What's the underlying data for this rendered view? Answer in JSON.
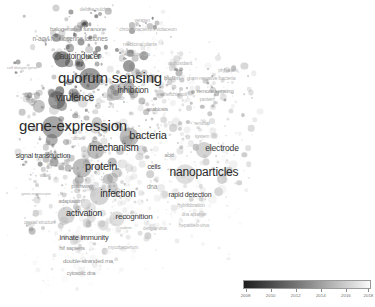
{
  "app": {
    "type": "bibliometric-overlay-map",
    "tool": "VOSviewer",
    "background_color": "#ffffff",
    "width": 375,
    "height": 307
  },
  "legend": {
    "name": "overlay-year-scale",
    "orientation": "horizontal",
    "position": "bottom-right",
    "gradient_from": "#1d1d1d",
    "gradient_to": "#fbfbfb",
    "min_year": 2008,
    "max_year": 2018,
    "ticks": [
      {
        "label": "2008",
        "pos": 2
      },
      {
        "label": "2010",
        "pos": 21.6
      },
      {
        "label": "2012",
        "pos": 41.2
      },
      {
        "label": "2014",
        "pos": 60.8
      },
      {
        "label": "2016",
        "pos": 80.4
      },
      {
        "label": "2018",
        "pos": 98
      }
    ]
  },
  "chart_data": {
    "type": "scatter",
    "title": "",
    "xlabel": "",
    "ylabel": "",
    "colormap": "grayscale-year-overlay",
    "color_range": [
      2008,
      2018
    ],
    "legend_position": "bottom-right",
    "grid": false,
    "terms": [
      {
        "label": "delisea pulchra",
        "x": 95,
        "y": 9,
        "size": 5.0,
        "weight": 0.22,
        "year": 2009,
        "style": "veryfaint"
      },
      {
        "label": "veragen",
        "x": 142,
        "y": 21,
        "size": 4.6,
        "weight": 0.18,
        "year": 2010,
        "style": "veryfaint"
      },
      {
        "label": "halogenated furanone",
        "x": 78,
        "y": 29,
        "size": 6.2,
        "weight": 0.4,
        "year": 2009,
        "style": "faint"
      },
      {
        "label": "chromobacterium violaceum",
        "x": 148,
        "y": 29,
        "size": 5.0,
        "weight": 0.22,
        "year": 2011,
        "style": "veryfaint"
      },
      {
        "label": "n-acyl homoserine lactones",
        "x": 70,
        "y": 39,
        "size": 6.6,
        "weight": 0.45,
        "year": 2009,
        "style": "faint"
      },
      {
        "label": "medicinal plants",
        "x": 140,
        "y": 45,
        "size": 5.2,
        "weight": 0.26,
        "year": 2015,
        "style": "veryfaint"
      },
      {
        "label": "essential oils",
        "x": 137,
        "y": 54,
        "size": 5.0,
        "weight": 0.22,
        "year": 2016,
        "style": "veryfaint"
      },
      {
        "label": "autoinducer",
        "x": 80,
        "y": 57,
        "size": 8.2,
        "weight": 0.6,
        "year": 2009,
        "style": "normal"
      },
      {
        "label": "cell division gene",
        "x": 22,
        "y": 68,
        "size": 4.4,
        "weight": 0.16,
        "year": 2010,
        "style": "veryfaint"
      },
      {
        "label": "antioxidant",
        "x": 180,
        "y": 64,
        "size": 5.4,
        "weight": 0.28,
        "year": 2016,
        "style": "veryfaint"
      },
      {
        "label": "quorum sensing",
        "x": 110,
        "y": 77,
        "size": 15.0,
        "weight": 1.0,
        "year": 2010,
        "style": "major"
      },
      {
        "label": "physalarm",
        "x": 228,
        "y": 71,
        "size": 4.6,
        "weight": 0.18,
        "year": 2014,
        "style": "veryfaint"
      },
      {
        "label": "biofilm",
        "x": 172,
        "y": 78,
        "size": 6.0,
        "weight": 0.38,
        "year": 2012,
        "style": "faint"
      },
      {
        "label": "gram-negative bacteria",
        "x": 211,
        "y": 79,
        "size": 5.2,
        "weight": 0.26,
        "year": 2011,
        "style": "veryfaint"
      },
      {
        "label": "inhibition",
        "x": 133,
        "y": 90,
        "size": 8.4,
        "weight": 0.62,
        "year": 2013,
        "style": "normal"
      },
      {
        "label": "remote sensing",
        "x": 215,
        "y": 92,
        "size": 5.8,
        "weight": 0.32,
        "year": 2015,
        "style": "faint"
      },
      {
        "label": "escherichia-coli",
        "x": 172,
        "y": 95,
        "size": 4.8,
        "weight": 0.2,
        "year": 2011,
        "style": "veryfaint"
      },
      {
        "label": "virulence",
        "x": 75,
        "y": 98,
        "size": 10.0,
        "weight": 0.72,
        "year": 2010,
        "style": "major"
      },
      {
        "label": "protein",
        "x": 207,
        "y": 100,
        "size": 5.2,
        "weight": 0.26,
        "year": 2012,
        "style": "veryfaint"
      },
      {
        "label": "emission",
        "x": 30,
        "y": 94,
        "size": 4.4,
        "weight": 0.16,
        "year": 2011,
        "style": "veryfaint"
      },
      {
        "label": "growth",
        "x": 118,
        "y": 99,
        "size": 4.6,
        "weight": 0.18,
        "year": 2012,
        "style": "veryfaint"
      },
      {
        "label": "anabiosis",
        "x": 157,
        "y": 110,
        "size": 5.6,
        "weight": 0.3,
        "year": 2013,
        "style": "faint"
      },
      {
        "label": "gene-expression",
        "x": 73,
        "y": 125,
        "size": 15.0,
        "weight": 0.98,
        "year": 2011,
        "style": "major"
      },
      {
        "label": "bacteria",
        "x": 148,
        "y": 135,
        "size": 11.0,
        "weight": 0.8,
        "year": 2013,
        "style": "major"
      },
      {
        "label": "removal",
        "x": 202,
        "y": 124,
        "size": 4.6,
        "weight": 0.18,
        "year": 2015,
        "style": "veryfaint"
      },
      {
        "label": "system",
        "x": 202,
        "y": 136,
        "size": 5.0,
        "weight": 0.22,
        "year": 2015,
        "style": "veryfaint"
      },
      {
        "label": "dimer",
        "x": 78,
        "y": 139,
        "size": 4.6,
        "weight": 0.18,
        "year": 2012,
        "style": "veryfaint"
      },
      {
        "label": "mechanism",
        "x": 114,
        "y": 148,
        "size": 10.0,
        "weight": 0.74,
        "year": 2013,
        "style": "major"
      },
      {
        "label": "signal transduction",
        "x": 43,
        "y": 155,
        "size": 7.0,
        "weight": 0.48,
        "year": 2011,
        "style": "normal"
      },
      {
        "label": "electrode",
        "x": 222,
        "y": 148,
        "size": 8.6,
        "weight": 0.64,
        "year": 2015,
        "style": "normal"
      },
      {
        "label": "acid",
        "x": 169,
        "y": 156,
        "size": 5.4,
        "weight": 0.28,
        "year": 2014,
        "style": "faint"
      },
      {
        "label": "reception",
        "x": 57,
        "y": 165,
        "size": 5.2,
        "weight": 0.26,
        "year": 2012,
        "style": "veryfaint"
      },
      {
        "label": "protein",
        "x": 101,
        "y": 166,
        "size": 11.0,
        "weight": 0.82,
        "year": 2013,
        "style": "major"
      },
      {
        "label": "cells",
        "x": 154,
        "y": 166,
        "size": 7.0,
        "weight": 0.48,
        "year": 2015,
        "style": "normal"
      },
      {
        "label": "nanoparticles",
        "x": 204,
        "y": 172,
        "size": 12.0,
        "weight": 0.86,
        "year": 2016,
        "style": "major"
      },
      {
        "label": "water",
        "x": 45,
        "y": 176,
        "size": 4.8,
        "weight": 0.2,
        "year": 2014,
        "style": "veryfaint"
      },
      {
        "label": "pathway",
        "x": 82,
        "y": 186,
        "size": 6.2,
        "weight": 0.4,
        "year": 2013,
        "style": "faint"
      },
      {
        "label": "dna",
        "x": 152,
        "y": 187,
        "size": 6.4,
        "weight": 0.42,
        "year": 2015,
        "style": "faint"
      },
      {
        "label": "infection",
        "x": 118,
        "y": 194,
        "size": 10.0,
        "weight": 0.76,
        "year": 2015,
        "style": "major"
      },
      {
        "label": "rapid detection",
        "x": 190,
        "y": 194,
        "size": 7.0,
        "weight": 0.48,
        "year": 2017,
        "style": "normal"
      },
      {
        "label": "gene-expression",
        "x": 36,
        "y": 194,
        "size": 4.4,
        "weight": 0.16,
        "year": 2013,
        "style": "veryfaint"
      },
      {
        "label": "adaptation",
        "x": 70,
        "y": 202,
        "size": 5.4,
        "weight": 0.28,
        "year": 2014,
        "style": "faint"
      },
      {
        "label": "hybridization",
        "x": 191,
        "y": 206,
        "size": 5.4,
        "weight": 0.28,
        "year": 2017,
        "style": "veryfaint"
      },
      {
        "label": "activation",
        "x": 84,
        "y": 213,
        "size": 9.0,
        "weight": 0.66,
        "year": 2015,
        "style": "major"
      },
      {
        "label": "recognition",
        "x": 134,
        "y": 217,
        "size": 8.0,
        "weight": 0.58,
        "year": 2016,
        "style": "normal"
      },
      {
        "label": "dna aptamer",
        "x": 194,
        "y": 215,
        "size": 4.8,
        "weight": 0.2,
        "year": 2017,
        "style": "veryfaint"
      },
      {
        "label": "crystal structure",
        "x": 40,
        "y": 222,
        "size": 5.0,
        "weight": 0.22,
        "year": 2014,
        "style": "veryfaint"
      },
      {
        "label": "valerie",
        "x": 126,
        "y": 228,
        "size": 4.4,
        "weight": 0.16,
        "year": 2016,
        "style": "veryfaint"
      },
      {
        "label": "dengue virus",
        "x": 155,
        "y": 229,
        "size": 4.6,
        "weight": 0.18,
        "year": 2017,
        "style": "veryfaint"
      },
      {
        "label": "hepatitis-b-virus",
        "x": 194,
        "y": 226,
        "size": 4.8,
        "weight": 0.2,
        "year": 2017,
        "style": "veryfaint"
      },
      {
        "label": "innate immunity",
        "x": 84,
        "y": 238,
        "size": 7.4,
        "weight": 0.52,
        "year": 2016,
        "style": "normal"
      },
      {
        "label": "hif sapiens",
        "x": 72,
        "y": 249,
        "size": 5.8,
        "weight": 0.32,
        "year": 2016,
        "style": "faint"
      },
      {
        "label": "mycobacterium",
        "x": 123,
        "y": 248,
        "size": 4.8,
        "weight": 0.2,
        "year": 2017,
        "style": "veryfaint"
      },
      {
        "label": "double-stranded rna",
        "x": 88,
        "y": 261,
        "size": 6.0,
        "weight": 0.38,
        "year": 2017,
        "style": "faint"
      },
      {
        "label": "cytosolic dna",
        "x": 81,
        "y": 274,
        "size": 5.4,
        "weight": 0.28,
        "year": 2018,
        "style": "faint"
      }
    ]
  }
}
